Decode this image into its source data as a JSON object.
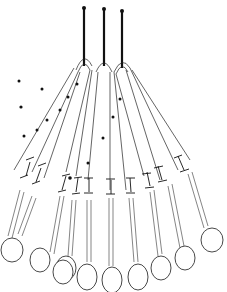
{
  "illustration": {
    "subject": "bobbin lace bobbins hanging from three pins",
    "pin_count": 3,
    "bobbin_count": 9,
    "colors": {
      "ink": "#111111",
      "background": "#ffffff"
    }
  }
}
